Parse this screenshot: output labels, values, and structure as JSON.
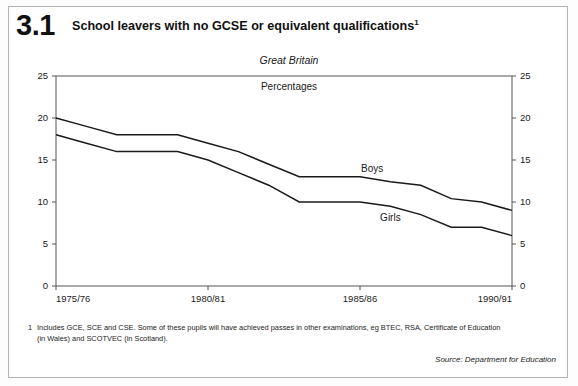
{
  "figure": {
    "number": "3.1",
    "title": "School leavers with no GCSE or equivalent qualifications",
    "title_footnote_marker": "1",
    "region": "Great Britain",
    "units": "Percentages"
  },
  "footnote": {
    "marker": "1",
    "text": "Includes GCE, SCE and CSE. Some of these pupils will have achieved passes in other examinations, eg BTEC, RSA, Certificate of Education (in Wales) and SCOTVEC (in Scotland)."
  },
  "source": "Source: Department for Education",
  "colors": {
    "line": "#1a1a1a",
    "axis": "#444444",
    "frame": "#b4b4b4",
    "background": "#ffffff"
  },
  "chart_data": {
    "type": "line",
    "title": "School leavers with no GCSE or equivalent qualifications",
    "subtitle": "Great Britain",
    "xlabel": "",
    "ylabel": "Percentages",
    "ylim": [
      0,
      25
    ],
    "yticks": [
      0,
      5,
      10,
      15,
      20,
      25
    ],
    "ytick_labels": [
      "0",
      "5",
      "10",
      "15",
      "20",
      "25"
    ],
    "right_axis": true,
    "right_ytick_labels": [
      "0",
      "5",
      "10",
      "15",
      "20",
      "25"
    ],
    "grid": false,
    "legend": "inline-labels",
    "x": [
      "1975/76",
      "1976/77",
      "1977/78",
      "1978/79",
      "1979/80",
      "1980/81",
      "1981/82",
      "1982/83",
      "1983/84",
      "1984/85",
      "1985/86",
      "1986/87",
      "1987/88",
      "1988/89",
      "1989/90",
      "1990/91"
    ],
    "xtick_labels": [
      "1975/76",
      "1980/81",
      "1985/86",
      "1990/91"
    ],
    "xtick_positions": [
      0,
      5,
      10,
      15
    ],
    "series": [
      {
        "name": "Boys",
        "values": [
          20,
          19,
          18,
          18,
          18,
          17,
          16,
          14.5,
          13,
          13,
          13,
          12.4,
          12,
          10.4,
          10,
          9
        ]
      },
      {
        "name": "Girls",
        "values": [
          18,
          17,
          16,
          16,
          16,
          15,
          13.5,
          12,
          10,
          10,
          10,
          9.5,
          8.5,
          7,
          7,
          6
        ]
      }
    ]
  }
}
